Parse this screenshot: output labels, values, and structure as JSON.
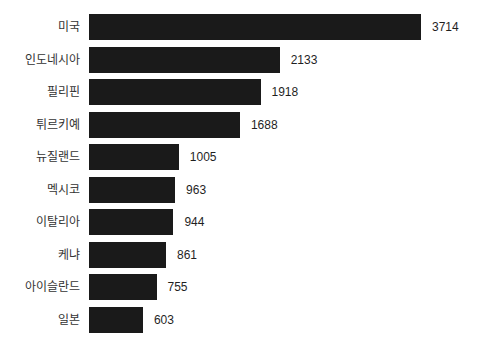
{
  "chart_data": {
    "type": "bar",
    "orientation": "horizontal",
    "title": "",
    "xlabel": "",
    "ylabel": "",
    "grid": false,
    "legend": false,
    "xlim": [
      0,
      3714
    ],
    "categories": [
      "미국",
      "인도네시아",
      "필리핀",
      "튀르키예",
      "뉴질랜드",
      "멕시코",
      "이탈리아",
      "케냐",
      "아이슬란드",
      "일본"
    ],
    "values": [
      3714,
      2133,
      1918,
      1688,
      1005,
      963,
      944,
      861,
      755,
      603
    ],
    "value_labels": [
      "3714",
      "2133",
      "1918",
      "1688",
      "1005",
      "963",
      "944",
      "861",
      "755",
      "603"
    ]
  },
  "colors": {
    "bar_color": "#1a1a1a",
    "category_label_color": "#333333",
    "value_label_color": "#1f1f1f",
    "background": "#ffffff"
  },
  "layout_hints": {
    "bar_max_width_px": 332,
    "bar_height_px": 26
  }
}
